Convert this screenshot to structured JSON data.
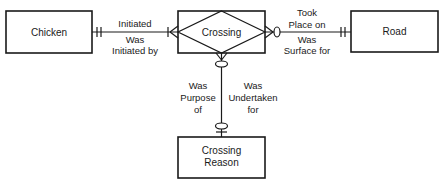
{
  "diagram": {
    "type": "entity-relationship",
    "colors": {
      "stroke": "#1a1a1a",
      "background": "#ffffff"
    },
    "entities": [
      {
        "id": "chicken",
        "label": "Chicken"
      },
      {
        "id": "crossing",
        "label": "Crossing",
        "associative": true
      },
      {
        "id": "road",
        "label": "Road"
      },
      {
        "id": "crossing_reason",
        "label_line1": "Crossing",
        "label_line2": "Reason"
      }
    ],
    "relationships": [
      {
        "from": "chicken",
        "to": "crossing",
        "forward_label": "Initiated",
        "reverse_label_line1": "Was",
        "reverse_label_line2": "Initiated by",
        "from_cardinality": "one-and-only-one",
        "to_cardinality": "one-or-many"
      },
      {
        "from": "road",
        "to": "crossing",
        "forward_label_line1": "Took",
        "forward_label_line2": "Place on",
        "reverse_label_line1": "Was",
        "reverse_label_line2": "Surface for",
        "from_cardinality": "one-and-only-one",
        "to_cardinality": "zero-or-many"
      },
      {
        "from": "crossing_reason",
        "to": "crossing",
        "left_label_line1": "Was",
        "left_label_line2": "Purpose",
        "left_label_line3": "of",
        "right_label_line1": "Was",
        "right_label_line2": "Undertaken",
        "right_label_line3": "for",
        "from_cardinality": "zero-or-one",
        "to_cardinality": "zero-or-many"
      }
    ]
  }
}
